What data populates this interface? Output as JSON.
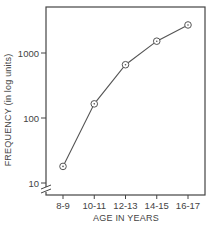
{
  "chart_data": {
    "type": "line",
    "title": "",
    "xlabel": "AGE IN YEARS",
    "ylabel": "FREQUENCY (in log units)",
    "yscale": "log",
    "ylim": [
      10,
      3500
    ],
    "yticks": [
      10,
      100,
      1000
    ],
    "ytick_labels": [
      "10",
      "100",
      "1000"
    ],
    "categories": [
      "8-9",
      "10-11",
      "12-13",
      "14-15",
      "16-17"
    ],
    "series": [
      {
        "name": "Frequency",
        "values": [
          18,
          165,
          660,
          1520,
          2700
        ],
        "marker": "circle-dot"
      }
    ],
    "grid": false,
    "legend": null,
    "axis_break": "y-axis break marks near bottom",
    "frame": "box"
  },
  "colors": {
    "line": "#555555",
    "axis": "#444444",
    "background": "#ffffff"
  }
}
